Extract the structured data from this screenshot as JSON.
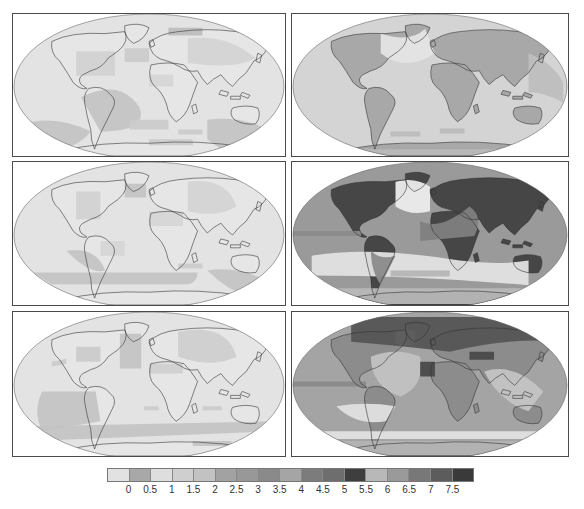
{
  "figure": {
    "layout": {
      "rows": 3,
      "cols": 2
    },
    "panels": [
      {
        "id": "r1c1",
        "row": 1,
        "col": 1,
        "ocean": "#e3e3e3",
        "land": "#e6e6e6",
        "patches": [
          {
            "shape": "m70,85 q40,-20 60,10 q10,25 -40,25 z",
            "color": "#c4c4c4"
          },
          {
            "shape": "m20,110 q30,-5 60,10 q-20,25 -60,15 z",
            "color": "#c4c4c4"
          },
          {
            "shape": "m120,108 l40,0 l0,10 l-40,0 z",
            "color": "#cbcbcb"
          },
          {
            "shape": "m140,128 l45,0 l0,6 l-45,0 z",
            "color": "#cbcbcb"
          },
          {
            "shape": "m200,108 q40,-5 70,15 l0,25 q-40,5 -70,-20 z",
            "color": "#c4c4c4"
          },
          {
            "shape": "m170,118 l25,0 l0,5 l-25,0 z",
            "color": "#cbcbcb"
          },
          {
            "shape": "m115,35 l25,0 l0,14 l-25,0 z",
            "color": "#cbcbcb"
          },
          {
            "shape": "m65,38 l40,0 l0,25 l-40,0 z",
            "color": "#d2d2d2"
          },
          {
            "shape": "m180,25 q40,-5 70,20 q-20,12 -70,5 z",
            "color": "#d4d4d4"
          },
          {
            "shape": "m140,62 l25,0 l0,12 l-25,0 z",
            "color": "#d6d6d6"
          },
          {
            "shape": "m160,14 l35,0 l0,8 l-35,0 z",
            "color": "#bdbdbd"
          }
        ]
      },
      {
        "id": "r1c2",
        "row": 1,
        "col": 2,
        "ocean": "#d4d4d4",
        "land": "#a8a8a8",
        "patches": [
          {
            "shape": "m0,138 l280,0 l0,6 l-280,0 z",
            "color": "#b8b8b8"
          },
          {
            "shape": "m100,120 l30,0 l0,5 l-30,0 z",
            "color": "#bcbcbc"
          },
          {
            "shape": "m150,117 l25,0 l0,5 l-25,0 z",
            "color": "#bcbcbc"
          },
          {
            "shape": "m90,20 q30,10 45,-5 l10,25 q-30,20 -55,0 z",
            "color": "#e4e4e4"
          },
          {
            "shape": "m240,40 q25,10 35,30 l0,20 q-20,-10 -35,-10 z",
            "color": "#bebebe"
          }
        ]
      },
      {
        "id": "r2c1",
        "row": 2,
        "col": 1,
        "ocean": "#e3e3e3",
        "land": "#e6e6e6",
        "patches": [
          {
            "shape": "m55,90 q30,-5 40,20 q-15,5 -40,-20 z",
            "color": "#c4c4c4"
          },
          {
            "shape": "m20,112 l170,0 q0,10 -10,12 l-140,0 z",
            "color": "#c4c4c4"
          },
          {
            "shape": "m200,110 q30,-5 60,10 l-10,20 q-30,-10 -50,-30 z",
            "color": "#c4c4c4"
          },
          {
            "shape": "m170,103 l25,0 l0,5 l-25,0 z",
            "color": "#cbcbcb"
          },
          {
            "shape": "m115,22 l22,0 l0,14 l-22,0 z",
            "color": "#c4c4c4"
          },
          {
            "shape": "m65,30 l25,0 l0,28 l-25,0 z",
            "color": "#d2d2d2"
          },
          {
            "shape": "m180,20 q40,-5 50,25 q-20,12 -50,5 z",
            "color": "#d4d4d4"
          },
          {
            "shape": "m140,50 l35,0 l0,15 l-35,0 z",
            "color": "#d6d6d6"
          },
          {
            "shape": "m90,80 l25,0 l0,15 l-25,0 z",
            "color": "#d6d6d6"
          }
        ]
      },
      {
        "id": "r2c2",
        "row": 2,
        "col": 2,
        "ocean": "#9a9a9a",
        "land": "#464646",
        "patches": [
          {
            "shape": "m0,70 l70,0 l0,5 l-70,0 z",
            "color": "#8a8a8a"
          },
          {
            "shape": "m20,95 q60,-10 150,5 q40,5 70,0 l0,25 q-110,-10 -220,-10 z",
            "color": "#e2e2e2"
          },
          {
            "shape": "m100,110 l60,0 l0,6 l-60,0 z",
            "color": "#b5b5b5"
          },
          {
            "shape": "m105,20 q20,-5 35,5 l0,25 q-20,5 -35,-5 z",
            "color": "#ececec"
          },
          {
            "shape": "m0,128 l280,0 l0,16 l-280,0 z",
            "color": "#b8b8b8"
          },
          {
            "shape": "m130,60 q20,10 50,-15 q15,10 5,30 l-55,5 z",
            "color": "#7f7f7f"
          },
          {
            "shape": "m80,90 q10,10 25,5 l-15,30 q-10,-15 -10,-35 z",
            "color": "#8b8b8b"
          }
        ]
      },
      {
        "id": "r3c1",
        "row": 3,
        "col": 1,
        "ocean": "#e3e3e3",
        "land": "#e6e6e6",
        "patches": [
          {
            "shape": "m30,80 l55,0 l5,30 l-60,10 q-10,-20 0,-40 z",
            "color": "#c4c4c4"
          },
          {
            "shape": "m20,115 l250,-5 l0,10 l-250,10 z",
            "color": "#c4c4c4"
          },
          {
            "shape": "m110,22 l22,0 l0,35 l-22,0 z",
            "color": "#c4c4c4"
          },
          {
            "shape": "m65,35 l25,0 l0,15 l-25,0 z",
            "color": "#cbcbcb"
          },
          {
            "shape": "m170,20 q50,-10 60,25 q-25,12 -60,0 z",
            "color": "#cfcfcf"
          },
          {
            "shape": "m140,52 l35,0 l0,10 l-35,0 z",
            "color": "#d0d0d0"
          },
          {
            "shape": "m40,50 l15,-3 l0,5 l-15,3 z",
            "color": "#cbcbcb"
          },
          {
            "shape": "m135,95 l15,0 l0,4 l-15,0 z",
            "color": "#cbcbcb"
          },
          {
            "shape": "m195,95 l20,0 l0,4 l-20,0 z",
            "color": "#cbcbcb"
          },
          {
            "shape": "m185,130 l40,0 l0,5 l-40,0 z",
            "color": "#c4c4c4"
          }
        ]
      },
      {
        "id": "r3c2",
        "row": 3,
        "col": 2,
        "ocean": "#a4a4a4",
        "land": "#8c8c8c",
        "patches": [
          {
            "shape": "m0,70 l75,0 l0,5 l-75,0 z",
            "color": "#8a8a8a"
          },
          {
            "shape": "m45,95 q30,-5 60,0 l-10,15 q-30,5 -50,-15 z",
            "color": "#e0e0e0"
          },
          {
            "shape": "m10,120 l270,0 l0,8 l-270,0 z",
            "color": "#e2e2e2"
          },
          {
            "shape": "m0,130 l280,0 l0,14 l-280,0 z",
            "color": "#b4b4b4"
          },
          {
            "shape": "m105,20 q10,-5 20,0 l0,12 q-10,5 -20,0 z",
            "color": "#f4f4f4"
          },
          {
            "shape": "m80,45 q25,-10 50,0 q5,30 -20,40 q-30,-10 -30,-40 z",
            "color": "#c2c2c2"
          },
          {
            "shape": "m60,5 l220,0 l0,25 q-60,-5 -120,10 q-40,-5 -100,-10 z",
            "color": "#555555"
          },
          {
            "shape": "m130,50 l15,0 l0,15 l-15,0 z",
            "color": "#4a4a4a"
          },
          {
            "shape": "m180,40 l25,0 l0,8 l-25,0 z",
            "color": "#4a4a4a"
          },
          {
            "shape": "m195,60 q30,-10 60,20 l-15,20 q-30,-10 -45,-40 z",
            "color": "#c4c4c4"
          }
        ]
      }
    ]
  },
  "legend": {
    "swatches": [
      "#e2e2e2",
      "#a8a8a8",
      "#dedede",
      "#cfcfcf",
      "#c2c2c2",
      "#a2a2a2",
      "#989898",
      "#8a8a8a",
      "#a5a5a5",
      "#7c7c7c",
      "#6e6e6e",
      "#3e3e3e",
      "#b8b8b8",
      "#9a9a9a",
      "#787878",
      "#5c5c5c",
      "#3a3a3a"
    ],
    "ticks": [
      "0",
      "0.5",
      "1",
      "1.5",
      "2",
      "2.5",
      "3",
      "3.5",
      "4",
      "4.5",
      "5",
      "5.5",
      "6",
      "6.5",
      "7",
      "7.5"
    ]
  }
}
